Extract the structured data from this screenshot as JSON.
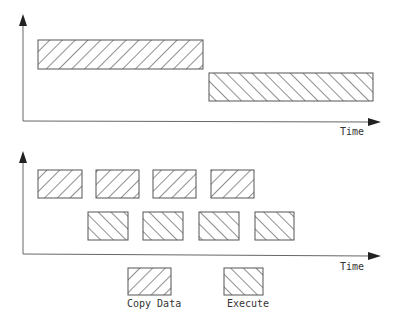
{
  "diagram": {
    "top_panel": {
      "axis_label": "Time",
      "blocks": [
        {
          "type": "copy",
          "x": 38,
          "y": 40,
          "w": 165,
          "h": 29
        },
        {
          "type": "execute",
          "x": 209,
          "y": 73,
          "w": 164,
          "h": 28
        }
      ]
    },
    "bottom_panel": {
      "axis_label": "Time",
      "copy_blocks": [
        {
          "x": 38,
          "y": 170,
          "w": 44,
          "h": 28
        },
        {
          "x": 96,
          "y": 170,
          "w": 43,
          "h": 28
        },
        {
          "x": 153,
          "y": 170,
          "w": 43,
          "h": 28
        },
        {
          "x": 211,
          "y": 170,
          "w": 43,
          "h": 28
        }
      ],
      "execute_blocks": [
        {
          "x": 88,
          "y": 212,
          "w": 40,
          "h": 28
        },
        {
          "x": 143,
          "y": 212,
          "w": 40,
          "h": 28
        },
        {
          "x": 199,
          "y": 212,
          "w": 40,
          "h": 28
        },
        {
          "x": 255,
          "y": 212,
          "w": 39,
          "h": 28
        }
      ]
    },
    "legend": [
      {
        "label": "Copy Data",
        "pattern": "forward-hatch"
      },
      {
        "label": "Execute",
        "pattern": "back-hatch"
      }
    ],
    "colors": {
      "line": "#555555",
      "hatch": "#333333",
      "background": "#ffffff"
    }
  }
}
